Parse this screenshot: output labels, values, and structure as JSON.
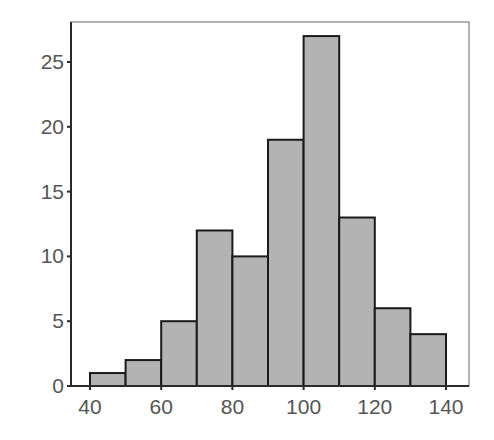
{
  "chart_data": {
    "type": "bar",
    "subtype": "histogram",
    "title": "",
    "xlabel": "",
    "ylabel": "",
    "bin_edges": [
      40,
      50,
      60,
      70,
      80,
      90,
      100,
      110,
      120,
      130,
      140
    ],
    "categories": [
      "40-50",
      "50-60",
      "60-70",
      "70-80",
      "80-90",
      "90-100",
      "100-110",
      "110-120",
      "120-130",
      "130-140"
    ],
    "values": [
      1,
      2,
      5,
      12,
      10,
      19,
      27,
      13,
      6,
      4
    ],
    "xlim": [
      35,
      145
    ],
    "ylim": [
      0,
      28
    ],
    "x_ticks": [
      40,
      60,
      80,
      100,
      120,
      140
    ],
    "x_tick_labels": [
      "40",
      "60",
      "80",
      "100",
      "120",
      "140"
    ],
    "y_ticks": [
      0,
      5,
      10,
      15,
      20,
      25
    ],
    "y_tick_labels": [
      "0",
      "5",
      "10",
      "15",
      "20",
      "25"
    ],
    "grid": false,
    "legend": null,
    "colors": {
      "bar_fill": "#b3b3b3",
      "bar_edge": "#1a1a1a",
      "frame": "#9a9a9a",
      "axis": "#2a2a2a",
      "tick_label": "#555555"
    }
  }
}
